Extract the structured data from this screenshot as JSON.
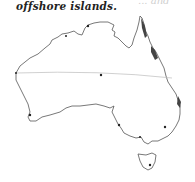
{
  "caption": {
    "text": "offshore islands.",
    "faded_fragment": "... and"
  },
  "map": {
    "subject": "Australia outline",
    "coast_color": "#555555",
    "reef_color": "#444444",
    "line_color": "#bbbbbb",
    "markers": [
      {
        "name": "center-dot",
        "x": 101,
        "y": 75
      },
      {
        "name": "northwest-point",
        "x": 16,
        "y": 73
      },
      {
        "name": "southwest-point",
        "x": 30,
        "y": 115
      },
      {
        "name": "top-end-point",
        "x": 88,
        "y": 26
      },
      {
        "name": "southeast-point-1",
        "x": 165,
        "y": 127
      },
      {
        "name": "southeast-point-2",
        "x": 119,
        "y": 125
      },
      {
        "name": "tasmania-point",
        "x": 150,
        "y": 165
      }
    ]
  }
}
